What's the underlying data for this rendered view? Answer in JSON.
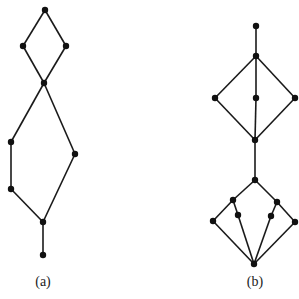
{
  "figure": {
    "graphs": [
      {
        "id": "a",
        "label": "(a)",
        "label_pos": [
          43,
          274
        ],
        "nodes": [
          {
            "id": "a1",
            "x": 45,
            "y": 10
          },
          {
            "id": "a2",
            "x": 23,
            "y": 46
          },
          {
            "id": "a3",
            "x": 66,
            "y": 46
          },
          {
            "id": "a4",
            "x": 44,
            "y": 83
          },
          {
            "id": "a5",
            "x": 11,
            "y": 142
          },
          {
            "id": "a6",
            "x": 75,
            "y": 154
          },
          {
            "id": "a7",
            "x": 11,
            "y": 189
          },
          {
            "id": "a8",
            "x": 43,
            "y": 222
          },
          {
            "id": "a9",
            "x": 43,
            "y": 255
          }
        ],
        "edges": [
          [
            "a1",
            "a2"
          ],
          [
            "a1",
            "a3"
          ],
          [
            "a2",
            "a4"
          ],
          [
            "a3",
            "a4"
          ],
          [
            "a4",
            "a5"
          ],
          [
            "a4",
            "a6"
          ],
          [
            "a5",
            "a7"
          ],
          [
            "a7",
            "a8"
          ],
          [
            "a6",
            "a8"
          ],
          [
            "a8",
            "a9"
          ]
        ]
      },
      {
        "id": "b",
        "label": "(b)",
        "label_pos": [
          255,
          274
        ],
        "nodes": [
          {
            "id": "b1",
            "x": 256,
            "y": 26
          },
          {
            "id": "b2",
            "x": 256,
            "y": 56
          },
          {
            "id": "b3",
            "x": 215,
            "y": 98
          },
          {
            "id": "b4",
            "x": 256,
            "y": 98
          },
          {
            "id": "b5",
            "x": 295,
            "y": 98
          },
          {
            "id": "b6",
            "x": 255,
            "y": 140
          },
          {
            "id": "b7",
            "x": 255,
            "y": 180
          },
          {
            "id": "b8",
            "x": 233,
            "y": 200
          },
          {
            "id": "b9",
            "x": 277,
            "y": 202
          },
          {
            "id": "b10",
            "x": 213,
            "y": 221
          },
          {
            "id": "b11",
            "x": 238,
            "y": 215
          },
          {
            "id": "b12",
            "x": 271,
            "y": 216
          },
          {
            "id": "b13",
            "x": 295,
            "y": 222
          },
          {
            "id": "b14",
            "x": 254,
            "y": 264
          }
        ],
        "edges": [
          [
            "b1",
            "b2"
          ],
          [
            "b2",
            "b3"
          ],
          [
            "b2",
            "b4"
          ],
          [
            "b2",
            "b5"
          ],
          [
            "b3",
            "b6"
          ],
          [
            "b4",
            "b6"
          ],
          [
            "b5",
            "b6"
          ],
          [
            "b6",
            "b7"
          ],
          [
            "b7",
            "b8"
          ],
          [
            "b7",
            "b9"
          ],
          [
            "b8",
            "b10"
          ],
          [
            "b8",
            "b11"
          ],
          [
            "b9",
            "b12"
          ],
          [
            "b9",
            "b13"
          ],
          [
            "b10",
            "b14"
          ],
          [
            "b11",
            "b14"
          ],
          [
            "b12",
            "b14"
          ],
          [
            "b13",
            "b14"
          ]
        ]
      }
    ]
  }
}
